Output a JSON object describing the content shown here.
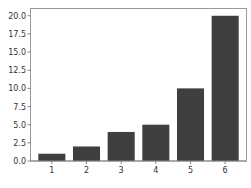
{
  "chart_data": {
    "type": "bar",
    "title": "",
    "xlabel": "",
    "ylabel": "",
    "categories": [
      "1",
      "2",
      "3",
      "4",
      "5",
      "6"
    ],
    "values": [
      1,
      2,
      4,
      5,
      10,
      20
    ],
    "ylim": [
      0,
      21
    ],
    "yticks": [
      "0.0",
      "2.5",
      "5.0",
      "7.5",
      "10.0",
      "12.5",
      "15.0",
      "17.5",
      "20.0"
    ],
    "ytick_values": [
      0,
      2.5,
      5,
      7.5,
      10,
      12.5,
      15,
      17.5,
      20
    ],
    "grid": false,
    "legend": null,
    "bar_color": "#3f3f3f",
    "axis_color": "#888888"
  }
}
